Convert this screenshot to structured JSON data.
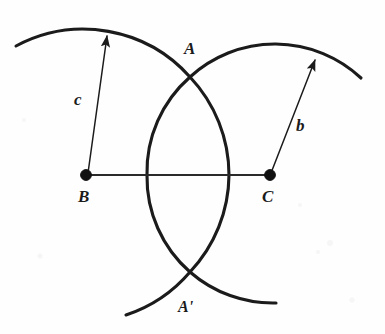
{
  "figure": {
    "background_color": "#fefefe",
    "ink_color": "#1b1b1b",
    "width": 385,
    "height": 334
  },
  "labels": {
    "vertex_a": "A",
    "vertex_a_prime": "A'",
    "vertex_b": "B",
    "vertex_c": "C",
    "side_b": "b",
    "side_c": "c"
  },
  "points": {
    "B": {
      "x": 86,
      "y": 175
    },
    "C": {
      "x": 270,
      "y": 175
    },
    "A": {
      "x": 190,
      "y": 77
    },
    "A_prime": {
      "x": 190,
      "y": 272
    }
  },
  "radii": {
    "c_from_B": 143,
    "b_from_C": 126
  },
  "arrows": {
    "c": {
      "from_x": 86,
      "from_y": 175,
      "to_x": 107,
      "to_y": 34,
      "label": "c"
    },
    "b": {
      "from_x": 270,
      "from_y": 175,
      "to_x": 316,
      "to_y": 58,
      "label": "b"
    }
  },
  "label_positions": {
    "A": {
      "x": 184,
      "y": 54
    },
    "A_prime": {
      "x": 178,
      "y": 312
    },
    "B": {
      "x": 78,
      "y": 202
    },
    "C": {
      "x": 262,
      "y": 202
    },
    "b": {
      "x": 296,
      "y": 131
    },
    "c": {
      "x": 74,
      "y": 105
    }
  }
}
